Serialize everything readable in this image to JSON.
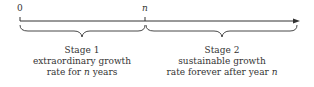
{
  "timeline": {
    "start_label": "0",
    "mid_label": "n"
  },
  "stages": [
    {
      "title": "Stage 1",
      "line1": "extraordinary growth",
      "line2_pre": "rate for ",
      "line2_var": "n",
      "line2_post": " years"
    },
    {
      "title": "Stage 2",
      "line1": "sustainable growth",
      "line2_pre": "rate forever after year ",
      "line2_var": "n",
      "line2_post": ""
    }
  ],
  "colors": {
    "stroke": "#333333"
  }
}
